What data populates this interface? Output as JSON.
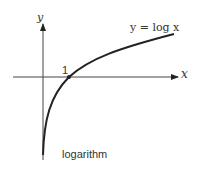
{
  "diagram": {
    "title": "logarithm",
    "curve_label": "y = log x",
    "x_axis_label": "x",
    "y_axis_label": "y",
    "intercept_label": "1",
    "colors": {
      "stroke": "#222222",
      "text": "#333333",
      "background": "#ffffff"
    }
  }
}
